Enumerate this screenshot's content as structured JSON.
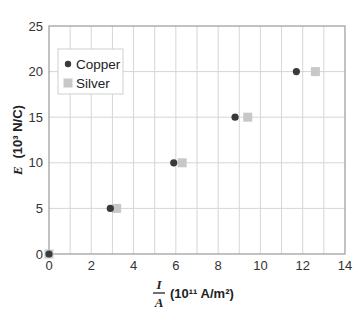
{
  "chart_data": {
    "type": "scatter",
    "title": "",
    "xlabel": "I/A (10^11 A/m²)",
    "xlabel_parts": {
      "numerator": "I",
      "denominator": "A",
      "units": "(10¹¹ A/m²)"
    },
    "ylabel": "E (10³ N/C)",
    "ylabel_parts": {
      "var": "E",
      "units": "(10³ N/C)"
    },
    "xlim": [
      0,
      14
    ],
    "ylim": [
      0,
      25
    ],
    "xticks": [
      0,
      2,
      4,
      6,
      8,
      10,
      12,
      14
    ],
    "yticks": [
      0,
      5,
      10,
      15,
      20,
      25
    ],
    "x_minor_grid_step": 1,
    "grid": true,
    "legend_position": "upper-left",
    "series": [
      {
        "name": "Copper",
        "marker": "circle",
        "color": "#3a3a3a",
        "x": [
          0,
          2.9,
          5.9,
          8.8,
          11.7
        ],
        "y": [
          0,
          5,
          10,
          15,
          20
        ]
      },
      {
        "name": "Silver",
        "marker": "square",
        "color": "#c8c8c8",
        "x": [
          0,
          3.2,
          6.3,
          9.4,
          12.6
        ],
        "y": [
          0,
          5,
          10,
          15,
          20
        ]
      }
    ]
  },
  "legend": {
    "items": [
      {
        "label": "Copper",
        "icon": "circle-marker-icon"
      },
      {
        "label": "Silver",
        "icon": "square-marker-icon"
      }
    ]
  },
  "colors": {
    "grid": "#d6d6d6",
    "frame": "#9a9a9a",
    "copper": "#3a3a3a",
    "silver": "#c8c8c8"
  }
}
